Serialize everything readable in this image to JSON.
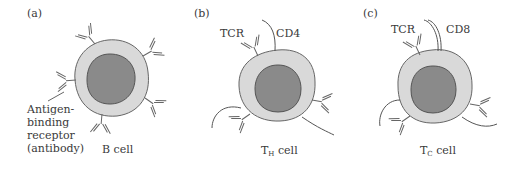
{
  "panels": [
    {
      "tag": "(a)",
      "cell_name": "B cell",
      "receptor_label": [
        "Antigen-",
        "binding",
        "receptor",
        "(antibody)"
      ]
    },
    {
      "tag": "(b)",
      "cell_prefix": "T",
      "cell_sub": "H",
      "cell_suffix": " cell",
      "receptor": "TCR",
      "coreceptor": "CD4"
    },
    {
      "tag": "(c)",
      "cell_prefix": "T",
      "cell_sub": "C",
      "cell_suffix": " cell",
      "receptor": "TCR",
      "coreceptor": "CD8"
    }
  ],
  "colors": {
    "cytoplasm": "#d9d9d9",
    "nucleus": "#8a8a8a",
    "outline": "#555555",
    "text": "#3a3a3a"
  }
}
